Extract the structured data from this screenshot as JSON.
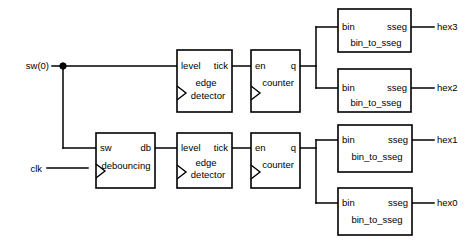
{
  "diagram": {
    "stroke_color": "#000000",
    "background_color": "#ffffff",
    "signals": {
      "sw0": "sw(0)",
      "clk": "clk",
      "hex3": "hex3",
      "hex2": "hex2",
      "hex1": "hex1",
      "hex0": "hex0"
    },
    "blocks": [
      {
        "id": "edge_detector_top",
        "name_line1": "edge",
        "name_line2": "detector",
        "input_port": "level",
        "output_port": "tick",
        "has_clock": true
      },
      {
        "id": "counter_top",
        "name_line1": "counter",
        "name_line2": "",
        "input_port": "en",
        "output_port": "q",
        "has_clock": true
      },
      {
        "id": "bin_to_sseg_hex3",
        "name_line1": "bin_to_sseg",
        "name_line2": "",
        "input_port": "bin",
        "output_port": "sseg",
        "has_clock": false
      },
      {
        "id": "bin_to_sseg_hex2",
        "name_line1": "bin_to_sseg",
        "name_line2": "",
        "input_port": "bin",
        "output_port": "sseg",
        "has_clock": false
      },
      {
        "id": "debouncing",
        "name_line1": "debouncing",
        "name_line2": "",
        "input_port": "sw",
        "output_port": "db",
        "has_clock": true
      },
      {
        "id": "edge_detector_bottom",
        "name_line1": "edge",
        "name_line2": "detector",
        "input_port": "level",
        "output_port": "tick",
        "has_clock": true
      },
      {
        "id": "counter_bottom",
        "name_line1": "counter",
        "name_line2": "",
        "input_port": "en",
        "output_port": "q",
        "has_clock": true
      },
      {
        "id": "bin_to_sseg_hex1",
        "name_line1": "bin_to_sseg",
        "name_line2": "",
        "input_port": "bin",
        "output_port": "sseg",
        "has_clock": false
      },
      {
        "id": "bin_to_sseg_hex0",
        "name_line1": "bin_to_sseg",
        "name_line2": "",
        "input_port": "bin",
        "output_port": "sseg",
        "has_clock": false
      }
    ]
  }
}
